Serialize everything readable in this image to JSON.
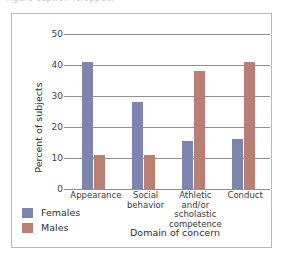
{
  "figure": {
    "top_caption_remnant": "Figure caption (cropped)"
  },
  "chart_data": {
    "type": "bar",
    "title": "",
    "xlabel": "Domain of concern",
    "ylabel": "Percent of subjects",
    "categories": [
      "Appearance",
      "Social\nbehavior",
      "Athletic and/or\nscholastic\ncompetence",
      "Conduct"
    ],
    "series": [
      {
        "name": "Females",
        "color": "#7c85b0",
        "values": [
          41,
          28,
          15.5,
          16
        ]
      },
      {
        "name": "Males",
        "color": "#b97f73",
        "values": [
          11,
          11,
          38,
          41
        ]
      }
    ],
    "ylim": [
      0,
      50
    ],
    "yticks": [
      0,
      10,
      20,
      30,
      40,
      50
    ],
    "ytick_labels": [
      "0",
      "10",
      "20",
      "30",
      "40",
      "50"
    ],
    "grid": "horizontal",
    "legend_position": "bottom-left"
  },
  "legend": {
    "items": [
      {
        "label": "Females",
        "color": "#7c85b0"
      },
      {
        "label": "Males",
        "color": "#b97f73"
      }
    ]
  }
}
